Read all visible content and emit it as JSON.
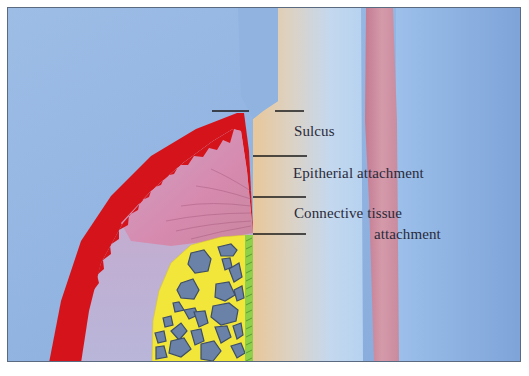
{
  "diagram": {
    "type": "anatomical-illustration",
    "labels": {
      "sulcus": "Sulcus",
      "epithelial": "Epitherial attachment",
      "connective_line1": "Connective tissue",
      "connective_line2": "attachment"
    },
    "regions": [
      {
        "name": "background-soft-tissue",
        "color": "#8fb3df"
      },
      {
        "name": "oral-epithelium",
        "color": "#d4141a"
      },
      {
        "name": "gingival-connective-tissue",
        "color": "#c98ab0"
      },
      {
        "name": "alveolar-bone",
        "color": "#f3e63a"
      },
      {
        "name": "bone-marrow-spaces",
        "color": "#6a82a8"
      },
      {
        "name": "periodontal-ligament",
        "color": "#8fd04a"
      },
      {
        "name": "tooth-root-cementum",
        "color": "#e6caa0"
      },
      {
        "name": "dentin",
        "color": "#b9d3ee"
      },
      {
        "name": "pulp",
        "color": "#c98a9e"
      }
    ],
    "colors": {
      "frame_border": "#5a6a80",
      "leader_line": "#1a1a1a",
      "text": "#2a2a3a"
    }
  }
}
